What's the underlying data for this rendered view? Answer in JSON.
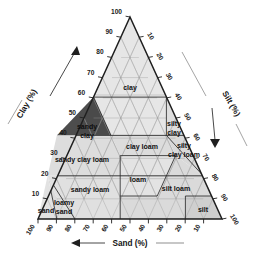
{
  "figure": {
    "type": "ternary-diagram"
  },
  "axes": {
    "left": {
      "name": "clay-axis",
      "label": "Clay (%)",
      "ticks": [
        "100",
        "90",
        "80",
        "70",
        "60",
        "50",
        "40",
        "30",
        "20",
        "10"
      ],
      "arrow": "up-arrow-icon"
    },
    "right": {
      "name": "silt-axis",
      "label": "Silt (%)",
      "ticks": [
        "10",
        "20",
        "30",
        "40",
        "50",
        "60",
        "70",
        "80",
        "90",
        "100"
      ],
      "arrow": "down-right-arrow-icon"
    },
    "bottom": {
      "name": "sand-axis",
      "label": "Sand (%)",
      "ticks": [
        "100",
        "90",
        "80",
        "70",
        "60",
        "50",
        "40",
        "30",
        "20",
        "10"
      ],
      "arrow": "left-arrow-icon"
    }
  },
  "colors": {
    "outline": "#2a2a2a",
    "grid": "#8d8d8d",
    "fill_light": "#e4e4e4",
    "fill_mid": "#cfcfcf",
    "fill_highlight": "#4a4a4a",
    "text": "#111111",
    "background": "#ffffff"
  },
  "regions": [
    {
      "id": "clay",
      "label": "clay",
      "highlighted": false,
      "lines": [
        "clay"
      ]
    },
    {
      "id": "silty-clay",
      "label": "silty clay",
      "highlighted": false,
      "lines": [
        "silty",
        "clay"
      ]
    },
    {
      "id": "sandy-clay",
      "label": "sandy clay",
      "highlighted": true,
      "lines": [
        "sandy",
        "clay"
      ]
    },
    {
      "id": "clay-loam",
      "label": "clay loam",
      "highlighted": false,
      "lines": [
        "clay loam"
      ]
    },
    {
      "id": "silty-clay-loam",
      "label": "silty clay loam",
      "highlighted": false,
      "lines": [
        "silty",
        "clay loam"
      ]
    },
    {
      "id": "sandy-clay-loam",
      "label": "sandy clay loam",
      "highlighted": false,
      "lines": [
        "sandy clay loam"
      ]
    },
    {
      "id": "loam",
      "label": "loam",
      "highlighted": false,
      "lines": [
        "loam"
      ]
    },
    {
      "id": "silt-loam",
      "label": "silt loam",
      "highlighted": false,
      "lines": [
        "silt loam"
      ]
    },
    {
      "id": "sandy-loam",
      "label": "sandy loam",
      "highlighted": false,
      "lines": [
        "sandy loam"
      ]
    },
    {
      "id": "loamy-sand",
      "label": "loamy sand",
      "highlighted": false,
      "lines": [
        "loamy",
        "sand"
      ]
    },
    {
      "id": "sand",
      "label": "sand",
      "highlighted": false,
      "lines": [
        "sand"
      ]
    },
    {
      "id": "silt",
      "label": "silt",
      "highlighted": false,
      "lines": [
        "silt"
      ]
    }
  ]
}
